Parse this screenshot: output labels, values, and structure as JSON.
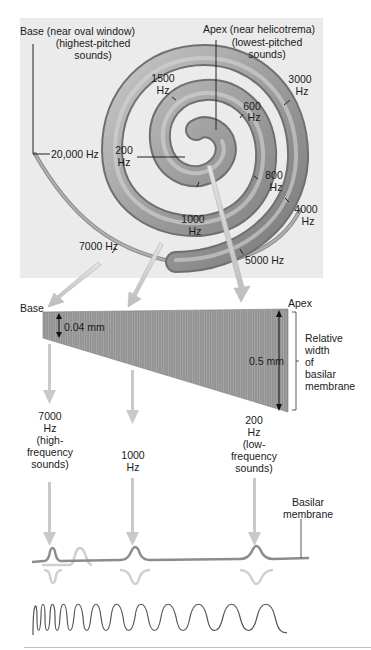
{
  "cochlea": {
    "base_label": "Base (near oval window)",
    "base_sub_1": "(highest-pitched",
    "base_sub_2": "sounds)",
    "apex_label": "Apex (near helicotrema)",
    "apex_sub_1": "(lowest-pitched",
    "apex_sub_2": "sounds)",
    "frequencies": [
      {
        "value": "20,000 Hz"
      },
      {
        "value": "1500",
        "unit": "Hz"
      },
      {
        "value": "3000",
        "unit": "Hz"
      },
      {
        "value": "600",
        "unit": "Hz"
      },
      {
        "value": "200",
        "unit": "Hz"
      },
      {
        "value": "800",
        "unit": "Hz"
      },
      {
        "value": "4000",
        "unit": "Hz"
      },
      {
        "value": "1000",
        "unit": "Hz"
      },
      {
        "value": "7000 Hz"
      },
      {
        "value": "5000 Hz"
      }
    ]
  },
  "membrane": {
    "base_label": "Base",
    "apex_label": "Apex",
    "base_width": "0.04 mm",
    "apex_width": "0.5 mm",
    "width_caption": [
      "Relative",
      "width",
      "of",
      "basilar",
      "membrane"
    ],
    "positions": [
      {
        "freq": "7000",
        "unit": "Hz",
        "desc_1": "(high-",
        "desc_2": "frequency",
        "desc_3": "sounds)"
      },
      {
        "freq": "1000",
        "unit": "Hz"
      },
      {
        "freq": "200",
        "unit": "Hz",
        "desc_1": "(low-",
        "desc_2": "frequency",
        "desc_3": "sounds)"
      }
    ]
  },
  "displacement": {
    "basilar_label_1": "Basilar",
    "basilar_label_2": "membrane"
  },
  "colors": {
    "panel": "#ebebeb",
    "spiral": "#9a9a9a",
    "membrane": "#8f8f8f",
    "arrow": "#c4c4c4",
    "wave": "#555555"
  }
}
